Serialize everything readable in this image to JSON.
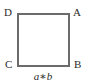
{
  "figure": {
    "type": "geometry-diagram",
    "shape": "square",
    "background_color": "#ffffff",
    "stroke_color": "#6b6b6b",
    "text_color": "#2b2b2b",
    "vertices": [
      {
        "id": "d",
        "label": "D",
        "position": "top-left"
      },
      {
        "id": "a",
        "label": "A",
        "position": "top-right"
      },
      {
        "id": "c",
        "label": "C",
        "position": "bottom-left"
      },
      {
        "id": "b",
        "label": "B",
        "position": "bottom-right"
      }
    ],
    "caption": {
      "operand_left": "a",
      "operator": "∗",
      "operand_right": "b",
      "full_text": "a∗b"
    }
  }
}
